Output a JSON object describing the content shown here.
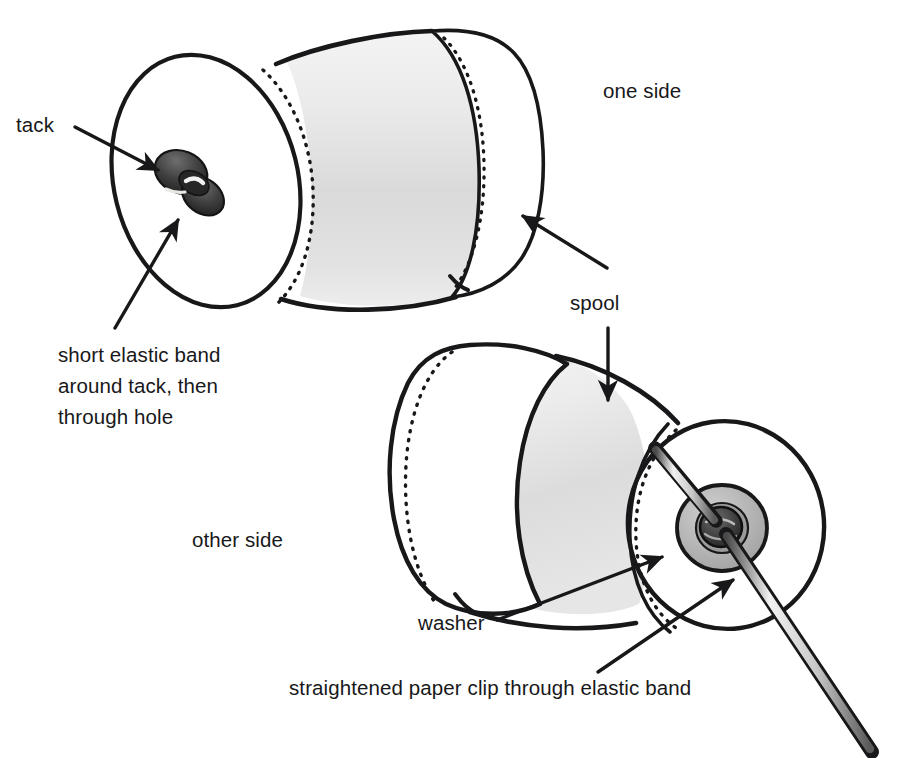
{
  "figure": {
    "medium": "hand-drawn pen-and-ink line illustration with grey wash shading",
    "background_color": "#ffffff",
    "ink_color": "#18181a",
    "shade_color": "#d9d9d9",
    "washer_color": "#b3b3b3",
    "cropped_text_above": "p  g  p        g"
  },
  "labels": {
    "tack": "tack",
    "one_side": "one side",
    "elastic_line1": "short elastic band",
    "elastic_line2": "around tack, then",
    "elastic_line3": "through hole",
    "spool": "spool",
    "other_side": "other side",
    "washer": "washer",
    "paper_clip": "straightened paper clip through elastic band"
  },
  "callouts": [
    {
      "name": "tack",
      "text": "tack",
      "points_to": "dark thumbtack head on upper spool end face"
    },
    {
      "name": "one-side",
      "text": "one side",
      "points_to": "upper spool (no arrow, free-standing caption)"
    },
    {
      "name": "short-elastic-band",
      "text": "short elastic band around tack, then through hole",
      "points_to": "elastic band looped around tack on upper spool"
    },
    {
      "name": "spool",
      "text": "spool",
      "points_to": "both spool bodies (two arrows: up-left and down)"
    },
    {
      "name": "other-side",
      "text": "other side",
      "points_to": "lower spool (no arrow, free-standing caption)"
    },
    {
      "name": "washer",
      "text": "washer",
      "points_to": "grey washer disc at hub of lower spool"
    },
    {
      "name": "straightened-paper-clip",
      "text": "straightened paper clip through elastic band",
      "points_to": "metal rod passing through the hub of the lower spool"
    }
  ],
  "objects": [
    {
      "name": "upper-spool",
      "caption": "one side",
      "parts": [
        "flanged end face",
        "shaded barrel",
        "tack",
        "elastic band"
      ]
    },
    {
      "name": "lower-spool",
      "caption": "other side",
      "parts": [
        "flanged end face",
        "shaded barrel",
        "washer",
        "elastic band hub",
        "straightened paper clip"
      ]
    }
  ]
}
